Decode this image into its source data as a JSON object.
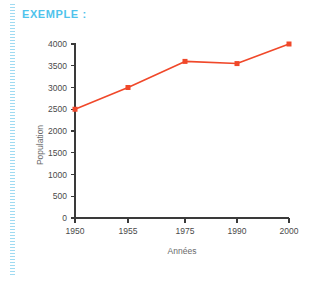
{
  "header": {
    "label": "EXEMPLE :",
    "color": "#4fc3ec"
  },
  "decoration": {
    "left_rule_color": "#8fd4ef"
  },
  "chart_data": {
    "type": "line",
    "title": "",
    "xlabel": "Années",
    "ylabel": "Population",
    "categories": [
      "1950",
      "1955",
      "1975",
      "1990",
      "2000"
    ],
    "values": [
      2500,
      3000,
      3600,
      3550,
      4000
    ],
    "x_tick_labels": [
      "1950",
      "1955",
      "1975",
      "1990",
      "2000"
    ],
    "y_tick_labels": [
      "0",
      "500",
      "1000",
      "1500",
      "2000",
      "2500",
      "3000",
      "3500",
      "4000"
    ],
    "y_ticks": [
      0,
      500,
      1000,
      1500,
      2000,
      2500,
      3000,
      3500,
      4000
    ],
    "ylim": [
      0,
      4000
    ],
    "grid": false,
    "legend": false,
    "series_color": "#f0482a",
    "marker": "square",
    "axis_color": "#3a3a3a"
  }
}
